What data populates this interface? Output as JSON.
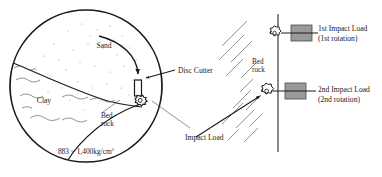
{
  "figure": {
    "name": "tunnel-boring-disc-cutter-impact-load-diagram",
    "type": "engineering-diagram",
    "background_color": "#ffffff",
    "line_color": "#1a1a1a",
    "block_fill_color": "#9a9a9a"
  },
  "left_panel": {
    "name": "tunnel-face-cross-section",
    "ground_layers": [
      {
        "key": "sand",
        "label": "Sand"
      },
      {
        "key": "clay",
        "label": "Clay"
      },
      {
        "key": "bedrock",
        "label_line1": "Bed",
        "label_line2": "rock"
      }
    ],
    "pressure_note": {
      "value": "883 ~ 1,400kg/cm",
      "superscript": "2"
    },
    "callouts": [
      {
        "key": "disc-cutter",
        "label": "Disc Cutter"
      },
      {
        "key": "impact-load",
        "label": "Impact Load"
      }
    ]
  },
  "right_panel": {
    "name": "bedrock-impact-sequence",
    "material_label": {
      "line1": "Bed",
      "line2": "rock"
    },
    "impacts": [
      {
        "key": "first-impact",
        "label_line1": "1st Impact Load",
        "label_line2": "(1st rotation)"
      },
      {
        "key": "second-impact",
        "label_line1": "2nd Impact Load",
        "label_line2": "(2nd rotation)"
      }
    ]
  }
}
